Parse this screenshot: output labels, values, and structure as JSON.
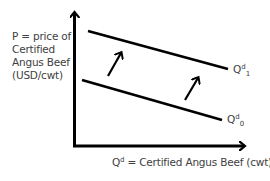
{
  "diagram": {
    "type": "demand-shift",
    "y_axis": {
      "label_lines": [
        "P = price of",
        "Certified",
        "Angus Beef",
        "(USD/cwt)"
      ]
    },
    "x_axis": {
      "label_base": "Q",
      "label_sup": "d",
      "label_rest": " = Certified Angus Beef (cwt)"
    },
    "curves": [
      {
        "name": "Q^d_1",
        "base": "Q",
        "sup": "d",
        "sub": "1",
        "position": "upper"
      },
      {
        "name": "Q^d_0",
        "base": "Q",
        "sup": "d",
        "sub": "0",
        "position": "lower"
      }
    ],
    "shift_arrows": {
      "count": 2,
      "direction": "up-right"
    },
    "colors": {
      "line": "#000000",
      "text": "#404040",
      "background": "#ffffff"
    }
  }
}
